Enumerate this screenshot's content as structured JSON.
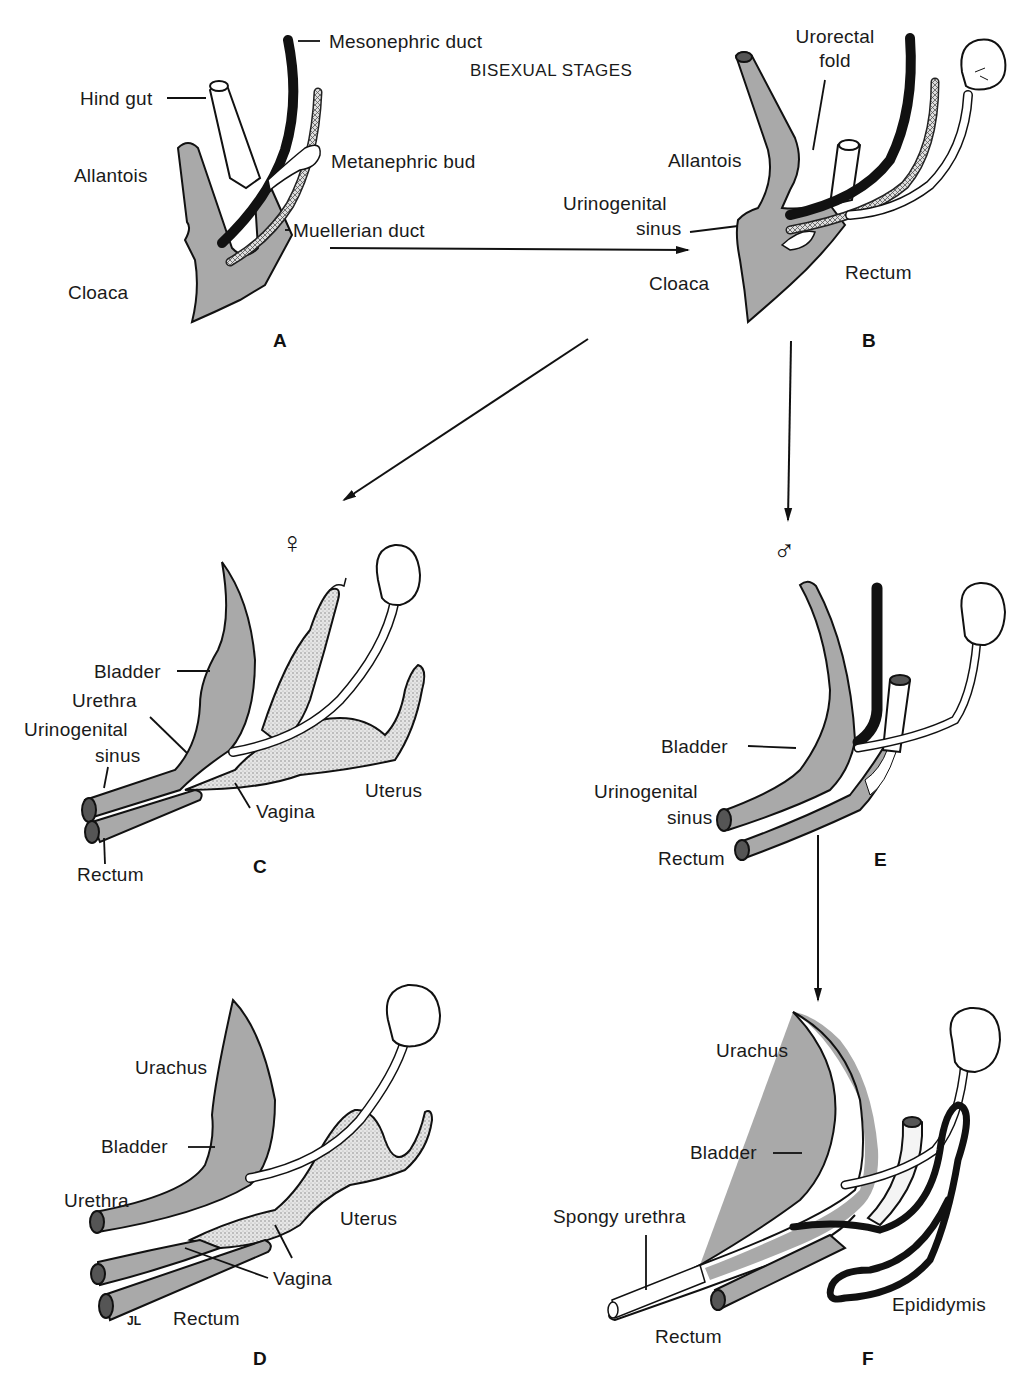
{
  "title": "BISEXUAL STAGES",
  "colors": {
    "tissue_gray": "#a9a9a9",
    "stipple": "#d8d8d8",
    "duct_black": "#111111",
    "outline": "#111111",
    "background": "#ffffff"
  },
  "panels": {
    "A": {
      "letter": "A",
      "labels": {
        "mesonephric_duct": "Mesonephric duct",
        "hind_gut": "Hind gut",
        "allantois": "Allantois",
        "metanephric_bud": "Metanephric bud",
        "muellerian_duct": "Muellerian duct",
        "cloaca": "Cloaca"
      }
    },
    "B": {
      "letter": "B",
      "labels": {
        "urorectal_fold_1": "Urorectal",
        "urorectal_fold_2": "fold",
        "allantois": "Allantois",
        "urogenital_sinus_1": "Urinogenital",
        "urogenital_sinus_2": "sinus",
        "cloaca": "Cloaca",
        "rectum": "Rectum"
      }
    },
    "C": {
      "letter": "C",
      "sex_symbol": "♀",
      "labels": {
        "bladder": "Bladder",
        "urethra": "Urethra",
        "urogenital_sinus_1": "Urinogenital",
        "urogenital_sinus_2": "sinus",
        "uterus": "Uterus",
        "vagina": "Vagina",
        "rectum": "Rectum"
      }
    },
    "D": {
      "letter": "D",
      "labels": {
        "urachus": "Urachus",
        "bladder": "Bladder",
        "urethra": "Urethra",
        "uterus": "Uterus",
        "vagina": "Vagina",
        "rectum": "Rectum",
        "signature": "JL"
      }
    },
    "E": {
      "letter": "E",
      "sex_symbol": "♂",
      "labels": {
        "bladder": "Bladder",
        "urogenital_sinus_1": "Urinogenital",
        "urogenital_sinus_2": "sinus",
        "rectum": "Rectum"
      }
    },
    "F": {
      "letter": "F",
      "labels": {
        "urachus": "Urachus",
        "bladder": "Bladder",
        "spongy_urethra": "Spongy urethra",
        "rectum": "Rectum",
        "epididymis": "Epididymis"
      }
    }
  },
  "arrows": [
    {
      "from": "A",
      "to": "B"
    },
    {
      "from": "B",
      "to": "C"
    },
    {
      "from": "B",
      "to": "E"
    },
    {
      "from": "E",
      "to": "F"
    }
  ]
}
